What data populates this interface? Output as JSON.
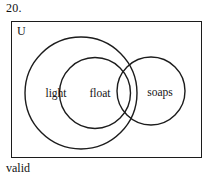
{
  "problem": {
    "number": "20.",
    "caption": "valid"
  },
  "diagram": {
    "type": "venn",
    "universe_label": "U",
    "universe_rect": {
      "x": 11,
      "y": 21,
      "width": 191,
      "height": 137
    },
    "sets": [
      {
        "name": "light",
        "label": "light",
        "cx": 81,
        "cy": 93,
        "r": 56,
        "label_x": 56,
        "label_y": 93
      },
      {
        "name": "float",
        "label": "float",
        "cx": 95,
        "cy": 93,
        "r": 35.5,
        "label_x": 100,
        "label_y": 93
      },
      {
        "name": "soaps",
        "label": "soaps",
        "cx": 151,
        "cy": 91,
        "r": 34,
        "label_x": 160,
        "label_y": 92
      }
    ],
    "relations": [
      "float is a subset of light",
      "soaps overlaps light",
      "soaps overlaps float"
    ],
    "stroke_color": "#1c1c1c",
    "fill_color": "#ffffff",
    "background_color": "#ffffff"
  }
}
